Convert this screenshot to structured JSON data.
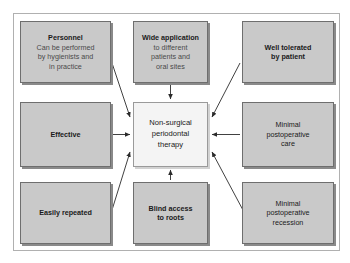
{
  "diagram": {
    "center": {
      "id": "center",
      "label": "Non-surgical periodontal therapy",
      "line1": "Non-surgical",
      "line2": "periodontal",
      "line3": "therapy",
      "fill": "#f4f4f4",
      "border": "#9a9a9a"
    },
    "node_fill": "#c9c9c9",
    "node_border": "#6e6e6e",
    "arrow_color": "#2b2b2b",
    "frame_border": "#b0b0b0",
    "nodes": [
      {
        "id": "personnel",
        "position": "top-left",
        "lead": "Personnel",
        "sub_line1": "Can be performed",
        "sub_line2": "by hygienists and",
        "sub_line3": "in practice",
        "arrow": "diagonal-down-right"
      },
      {
        "id": "wide-application",
        "position": "top-center",
        "lead": "Wide application",
        "sub_line1": "to different",
        "sub_line2": "patients and",
        "sub_line3": "oral sites",
        "arrow": "straight-down"
      },
      {
        "id": "well-tolerated",
        "position": "top-right",
        "line1": "Well tolerated",
        "line2": "by patient",
        "arrow": "diagonal-down-left"
      },
      {
        "id": "effective",
        "position": "middle-left",
        "line1": "Effective",
        "arrow": "straight-right"
      },
      {
        "id": "minimal-postoperative-care",
        "position": "middle-right",
        "line1": "Minimal",
        "line2": "postoperative",
        "line3": "care",
        "arrow": "straight-left"
      },
      {
        "id": "easily-repeated",
        "position": "bottom-left",
        "line1": "Easily repeated",
        "arrow": "diagonal-up-right"
      },
      {
        "id": "blind-access-to-roots",
        "position": "bottom-center",
        "line1": "Blind access",
        "line2": "to roots",
        "arrow": "straight-up"
      },
      {
        "id": "minimal-postoperative-recession",
        "position": "bottom-right",
        "line1": "Minimal",
        "line2": "postoperative",
        "line3": "recession",
        "arrow": "diagonal-up-left"
      }
    ]
  }
}
